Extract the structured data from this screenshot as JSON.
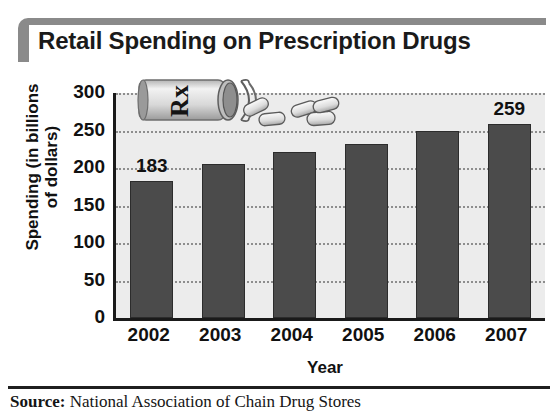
{
  "title": "Retail Spending on Prescription Drugs",
  "source": {
    "label": "Source:",
    "text": " National Association of Chain Drug Stores"
  },
  "artwork": {
    "name": "prescription-pill-bottle-illustration",
    "rx_text": "Rx"
  },
  "colors": {
    "bar": "#4b4b4b",
    "bar_edge": "#2c2c2c",
    "plot_background": "#ececec",
    "axis": "#1a1a1a",
    "gridline": "#8d8d8d",
    "title_frame": "#8a8a8a",
    "text": "#111111"
  },
  "chart_data": {
    "type": "bar",
    "title": "Retail Spending on Prescription Drugs",
    "xlabel": "Year",
    "ylabel": "Spending (in billions of dollars)",
    "ylabel_lines": [
      "Spending (in billions",
      "of dollars)"
    ],
    "categories": [
      "2002",
      "2003",
      "2004",
      "2005",
      "2006",
      "2007"
    ],
    "values": [
      183,
      205,
      222,
      232,
      250,
      259
    ],
    "data_labels": [
      "183",
      "",
      "",
      "",
      "",
      "259"
    ],
    "ylim": [
      0,
      300
    ],
    "yticks": [
      0,
      50,
      100,
      150,
      200,
      250,
      300
    ],
    "ytick_labels": [
      "0",
      "50",
      "100",
      "150",
      "200",
      "250",
      "300"
    ],
    "grid": true,
    "grid_axis": "y",
    "grid_style": "dotted",
    "legend": false,
    "units": "billions of dollars"
  }
}
